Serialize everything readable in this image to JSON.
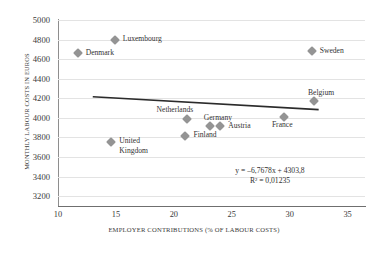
{
  "chart_data": {
    "type": "scatter",
    "title": "",
    "xlabel": "EMPLOYER CONTRIBUTIONS (% OF LABOUR COSTS)",
    "ylabel": "MONTHLY LABOUR COSTS IN EUROS",
    "xlim": [
      10,
      36.5
    ],
    "ylim": [
      3100,
      5000
    ],
    "xticks": [
      "10",
      "15",
      "20",
      "25",
      "30",
      "35"
    ],
    "xtick_values": [
      10,
      15,
      20,
      25,
      30,
      35
    ],
    "yticks": [
      "5000",
      "4800",
      "4600",
      "4400",
      "4200",
      "4000",
      "3800",
      "3600",
      "3400",
      "3200"
    ],
    "ytick_values": [
      5000,
      4800,
      4600,
      4400,
      4200,
      4000,
      3800,
      3600,
      3400,
      3200
    ],
    "grid": "horizontal",
    "legend": "none",
    "marker_color": "#949494",
    "marker_shape": "diamond",
    "trendline_color": "#2b2b2b",
    "gridline_color": "#e3e3e3",
    "points": [
      {
        "label": "Luxembourg",
        "x": 14.9,
        "y": 4800,
        "label_pos": "right"
      },
      {
        "label": "Denmark",
        "x": 11.7,
        "y": 4660,
        "label_pos": "right"
      },
      {
        "label": "Sweden",
        "x": 31.9,
        "y": 4680,
        "label_pos": "right"
      },
      {
        "label": "Belgium",
        "x": 32.1,
        "y": 4175,
        "label_pos": "above-right"
      },
      {
        "label": "Netherlands",
        "x": 21.1,
        "y": 3990,
        "label_pos": "above"
      },
      {
        "label": "Germany",
        "x": 23.1,
        "y": 3920,
        "label_pos": "above-right"
      },
      {
        "label": "Austria",
        "x": 24.0,
        "y": 3920,
        "label_pos": "right"
      },
      {
        "label": "France",
        "x": 29.5,
        "y": 4010,
        "label_pos": "below"
      },
      {
        "label": "Finland",
        "x": 21.0,
        "y": 3820,
        "label_pos": "right"
      },
      {
        "label": "United Kingdom",
        "x": 14.6,
        "y": 3755,
        "label_pos": "right-wrap"
      }
    ],
    "trendline": {
      "equation": "y = –6,7678x + 4303,8",
      "r_squared": "R² = 0,01235",
      "slope": -6.7678,
      "intercept": 4303.8,
      "x_start": 13.0,
      "x_end": 32.5
    }
  }
}
